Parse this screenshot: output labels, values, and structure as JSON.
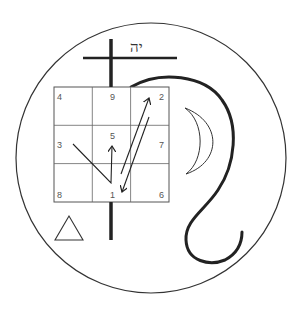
{
  "figure": {
    "title": "",
    "hebrew_label": "יה",
    "colors": {
      "background": "#ffffff",
      "ink": "#222222",
      "grid": "#555555",
      "numbers": "#555555"
    }
  },
  "circle": {
    "cx": 151,
    "cy": 158,
    "r": 135
  },
  "cross": {
    "vertical": {
      "x": 111,
      "y1": 39,
      "y2": 240
    },
    "horizontal": {
      "y": 58,
      "x1": 83,
      "x2": 177
    }
  },
  "magic_square": {
    "x": 54,
    "y": 87,
    "cell": 38.3,
    "rows": [
      [
        "4",
        "9",
        "2"
      ],
      [
        "3",
        "5",
        "7"
      ],
      [
        "8",
        "1",
        "6"
      ]
    ]
  },
  "symbols": {
    "crescent": "crescent-moon",
    "triangle": "triangle",
    "serpent": "serpent-curve",
    "arrows": [
      "path 3→1→5",
      "arrow 1→2",
      "arrow 2→1"
    ]
  }
}
